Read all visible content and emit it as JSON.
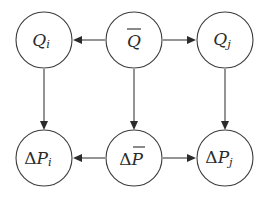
{
  "diagram": {
    "type": "causal-graph",
    "background_color": "#ffffff",
    "stroke_color": "#3c3c3c",
    "text_color": "#2b2b2b",
    "node_radius": 28,
    "nodes": [
      {
        "id": "q-i",
        "name": "node-q-i",
        "base": "Q",
        "subscript": "i",
        "overbar": false,
        "prefix": "",
        "label_text": "Q_i",
        "cx": 44,
        "cy": 40,
        "row": "top",
        "column": "left"
      },
      {
        "id": "q-bar",
        "name": "node-q-bar",
        "base": "Q",
        "subscript": "",
        "overbar": true,
        "prefix": "",
        "label_text": "Q-bar",
        "cx": 134,
        "cy": 40,
        "row": "top",
        "column": "middle"
      },
      {
        "id": "q-j",
        "name": "node-q-j",
        "base": "Q",
        "subscript": "j",
        "overbar": false,
        "prefix": "",
        "label_text": "Q_j",
        "cx": 225,
        "cy": 40,
        "row": "top",
        "column": "right"
      },
      {
        "id": "delta-p-i",
        "name": "node-delta-p-i",
        "base": "P",
        "subscript": "i",
        "overbar": false,
        "prefix": "Δ",
        "label_text": "ΔP_i",
        "cx": 44,
        "cy": 158,
        "row": "bottom",
        "column": "left"
      },
      {
        "id": "delta-p-bar",
        "name": "node-delta-p-bar",
        "base": "P",
        "subscript": "",
        "overbar": true,
        "prefix": "Δ",
        "label_text": "ΔP-bar",
        "cx": 134,
        "cy": 158,
        "row": "bottom",
        "column": "middle"
      },
      {
        "id": "delta-p-j",
        "name": "node-delta-p-j",
        "base": "P",
        "subscript": "j",
        "overbar": false,
        "prefix": "Δ",
        "label_text": "ΔP_j",
        "cx": 225,
        "cy": 158,
        "row": "bottom",
        "column": "right"
      }
    ],
    "edges": [
      {
        "id": "qbar-to-qi",
        "name": "edge-qbar-to-qi",
        "from": "q-bar",
        "to": "q-i",
        "direction": "left"
      },
      {
        "id": "qbar-to-qj",
        "name": "edge-qbar-to-qj",
        "from": "q-bar",
        "to": "q-j",
        "direction": "right"
      },
      {
        "id": "dpbar-to-dpi",
        "name": "edge-dpbar-to-dpi",
        "from": "delta-p-bar",
        "to": "delta-p-i",
        "direction": "left"
      },
      {
        "id": "dpbar-to-dpj",
        "name": "edge-dpbar-to-dpj",
        "from": "delta-p-bar",
        "to": "delta-p-j",
        "direction": "right"
      },
      {
        "id": "qi-to-dpi",
        "name": "edge-qi-to-dpi",
        "from": "q-i",
        "to": "delta-p-i",
        "direction": "down"
      },
      {
        "id": "qbar-to-dpbar",
        "name": "edge-qbar-to-dpbar",
        "from": "q-bar",
        "to": "delta-p-bar",
        "direction": "down"
      },
      {
        "id": "qj-to-dpj",
        "name": "edge-qj-to-dpj",
        "from": "q-j",
        "to": "delta-p-j",
        "direction": "down"
      }
    ]
  }
}
